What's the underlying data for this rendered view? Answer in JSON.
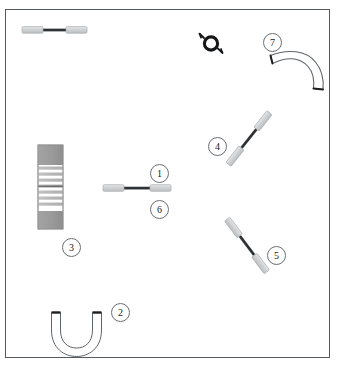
{
  "diagram": {
    "frame": {
      "x": 5,
      "y": 9,
      "width": 325,
      "height": 349,
      "border_color": "#555a5e"
    },
    "background_color": "#ffffff"
  },
  "palette": {
    "outline": "#6a6f73",
    "sleeve_fill": "#d2d4d6",
    "sleeve_stroke": "#a9adb0",
    "shaft_dark": "#2b2d2f",
    "block_cap_fill": "#9a9a9a",
    "block_band_fill": "#b9b9b9",
    "ring_black": "#141618",
    "hose_outline": "#5f6468",
    "hose_end_dark": "#1c1e20"
  },
  "callouts": [
    {
      "id": "1",
      "label": "1",
      "x": 150,
      "y": 164,
      "target": "connector-rod-center"
    },
    {
      "id": "2",
      "label": "2",
      "x": 111,
      "y": 303,
      "target": "u-shaped-hose"
    },
    {
      "id": "3",
      "label": "3",
      "x": 62,
      "y": 238,
      "target": "striped-block"
    },
    {
      "id": "4",
      "label": "4",
      "x": 208,
      "y": 137,
      "target": "connector-rod-upper-right"
    },
    {
      "id": "5",
      "label": "5",
      "x": 267,
      "y": 246,
      "target": "connector-rod-lower-right"
    },
    {
      "id": "6",
      "label": "6",
      "x": 150,
      "y": 200,
      "target": "connector-rod-center"
    },
    {
      "id": "7",
      "label": "7",
      "x": 263,
      "y": 33,
      "target": "curved-elbow-hose"
    }
  ],
  "parts": [
    {
      "name": "connector-rod-top-left",
      "type": "rod",
      "description": "Horizontal rod with light gray sleeves at both ends",
      "x1": 22,
      "y1": 30,
      "x2": 86,
      "y2": 30
    },
    {
      "name": "connector-rod-center",
      "type": "rod",
      "description": "Horizontal rod with light gray sleeves at both ends",
      "x1": 103,
      "y1": 188,
      "x2": 170,
      "y2": 188
    },
    {
      "name": "connector-rod-upper-right",
      "type": "rod",
      "description": "Diagonal rod with light gray sleeves at both ends",
      "x1": 228,
      "y1": 165,
      "x2": 270,
      "y2": 112
    },
    {
      "name": "connector-rod-lower-right",
      "type": "rod",
      "description": "Diagonal rod with light gray sleeves at both ends",
      "x1": 227,
      "y1": 219,
      "x2": 267,
      "y2": 272
    },
    {
      "name": "striped-block",
      "type": "banded-block",
      "description": "Vertical block with gray end caps and horizontal bands",
      "x": 38,
      "y": 145,
      "width": 25,
      "height": 84,
      "band_count": 7
    },
    {
      "name": "u-shaped-hose",
      "type": "hose",
      "description": "U-shaped hose with dark openings at both ends",
      "x": 50,
      "y": 310,
      "width": 52,
      "height": 45
    },
    {
      "name": "ring-clamp",
      "type": "ring",
      "description": "Black ring with two angled tabs",
      "cx": 211,
      "cy": 43,
      "r": 7
    },
    {
      "name": "curved-elbow-hose",
      "type": "hose",
      "description": "Curved elbow hose bending from left to lower right",
      "x": 268,
      "y": 50,
      "width": 58,
      "height": 42
    }
  ]
}
